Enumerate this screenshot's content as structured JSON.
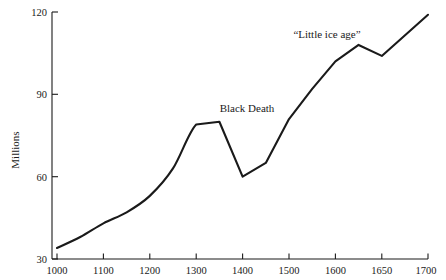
{
  "chart_data": {
    "type": "line",
    "title": "",
    "subtitle": "",
    "xlabel": "",
    "ylabel": "Millions",
    "xlim": [
      1000,
      1700
    ],
    "ylim": [
      30,
      120
    ],
    "grid": false,
    "legend": "none",
    "x_tick_labels": [
      "1000",
      "1100",
      "1200",
      "1300",
      "1400",
      "1500",
      "1600",
      "1650",
      "1700"
    ],
    "x_tick_values": [
      1000,
      1100,
      1200,
      1300,
      1400,
      1500,
      1600,
      1650,
      1700
    ],
    "y_tick_labels": [
      "30",
      "60",
      "90",
      "120"
    ],
    "y_tick_values": [
      30,
      60,
      90,
      120
    ],
    "series": [
      {
        "name": "European population",
        "color": "#1a1a1a",
        "x": [
          1000,
          1050,
          1100,
          1150,
          1200,
          1250,
          1300,
          1350,
          1400,
          1450,
          1500,
          1550,
          1600,
          1625,
          1650,
          1700
        ],
        "values": [
          34,
          38,
          43,
          47,
          53,
          63,
          79,
          80,
          60,
          65,
          81,
          92,
          102,
          108,
          104,
          119
        ]
      }
    ],
    "annotations": [
      {
        "text": "Black Death",
        "x": 1350,
        "y": 90
      },
      {
        "text": "“Little ice age”",
        "x": 1590,
        "y": 116
      }
    ]
  },
  "axis": {
    "y_title": "Millions"
  }
}
